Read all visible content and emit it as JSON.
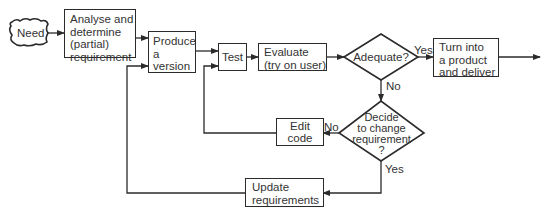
{
  "diagram": {
    "type": "flowchart",
    "colors": {
      "stroke": "#2b2b2b",
      "text": "#333333",
      "background": "#ffffff"
    },
    "nodes": {
      "need": {
        "shape": "cloud",
        "label": "Need"
      },
      "analyse": {
        "shape": "rect",
        "lines": [
          "Analyse and",
          "determine",
          "(partial)",
          "requirement"
        ]
      },
      "produce": {
        "shape": "rect",
        "lines": [
          "Produce",
          "a",
          "version"
        ]
      },
      "test": {
        "shape": "rect",
        "label": "Test"
      },
      "evaluate": {
        "shape": "rect",
        "lines": [
          "Evaluate",
          "(try on user)"
        ]
      },
      "adequate": {
        "shape": "diamond",
        "label": "Adequate?"
      },
      "deliver": {
        "shape": "rect",
        "lines": [
          "Turn into",
          "a product",
          "and deliver"
        ]
      },
      "decide": {
        "shape": "diamond",
        "lines": [
          "Decide",
          "to change",
          "requirement",
          "?"
        ]
      },
      "edit": {
        "shape": "rect",
        "lines": [
          "Edit",
          "code"
        ]
      },
      "update": {
        "shape": "rect",
        "lines": [
          "Update",
          "requirements"
        ]
      }
    },
    "edge_labels": {
      "adequate_yes": "Yes",
      "adequate_no": "No",
      "decide_no": "No",
      "decide_yes": "Yes"
    },
    "edges": [
      {
        "from": "need",
        "to": "analyse"
      },
      {
        "from": "analyse",
        "to": "produce"
      },
      {
        "from": "produce",
        "to": "test"
      },
      {
        "from": "test",
        "to": "evaluate"
      },
      {
        "from": "evaluate",
        "to": "adequate"
      },
      {
        "from": "adequate",
        "to": "deliver",
        "label": "Yes"
      },
      {
        "from": "deliver",
        "to": "output"
      },
      {
        "from": "adequate",
        "to": "decide",
        "label": "No"
      },
      {
        "from": "decide",
        "to": "edit",
        "label": "No"
      },
      {
        "from": "edit",
        "to": "test"
      },
      {
        "from": "decide",
        "to": "update",
        "label": "Yes"
      },
      {
        "from": "update",
        "to": "produce"
      }
    ]
  }
}
